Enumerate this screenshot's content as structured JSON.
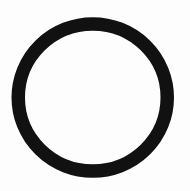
{
  "figure": {
    "shape": "ring-icon",
    "description": "Black circular ring outline on white background",
    "colors": {
      "background": "#fdfdfd",
      "ring": "#111111"
    },
    "geometry": {
      "cx": 92.75,
      "cy": 97.5,
      "rx": 74.5,
      "ry": 73.5,
      "stroke_width": 13.5
    }
  }
}
